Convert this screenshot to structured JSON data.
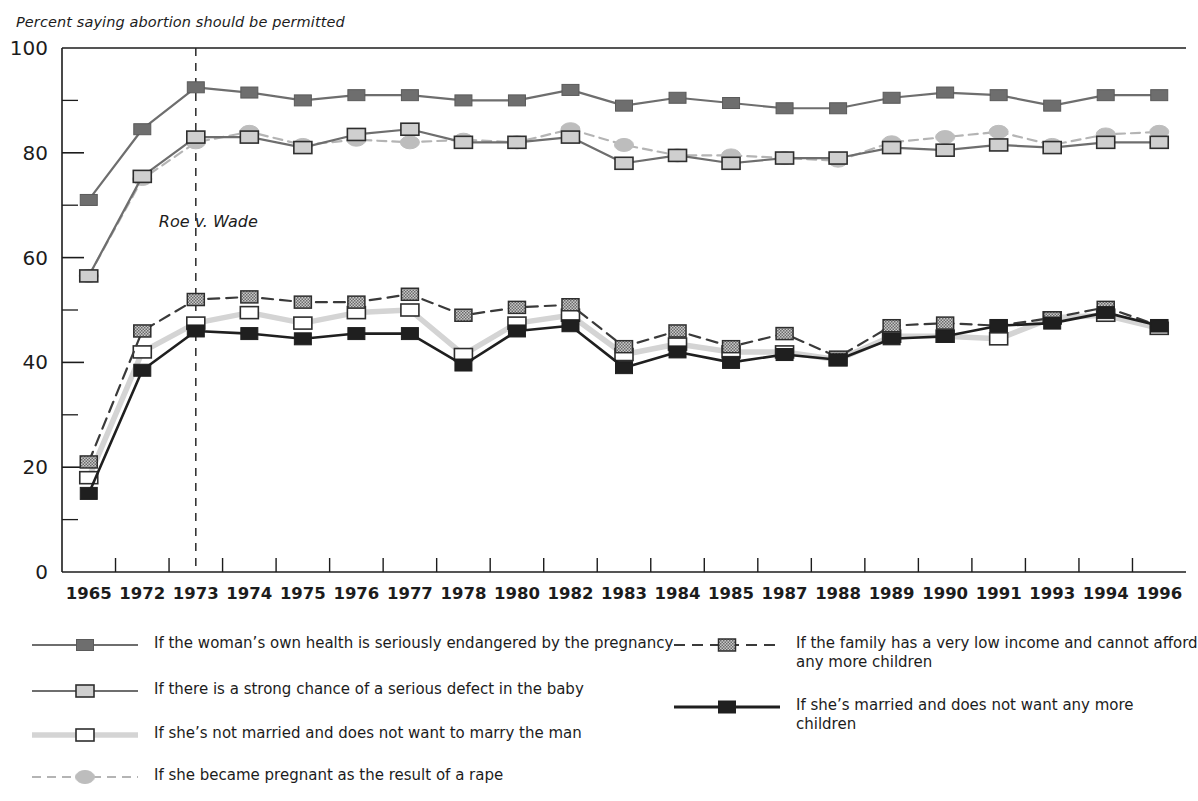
{
  "chart_data": {
    "type": "line",
    "title": "Percent saying abortion should be permitted",
    "ylabel": "Percent saying abortion should be permitted",
    "xlabel": "",
    "ylim": [
      0,
      100
    ],
    "yticks": [
      0,
      20,
      40,
      60,
      80,
      100
    ],
    "yticks_minor": [
      10,
      30,
      50,
      70,
      90
    ],
    "grid": false,
    "legend_position": "bottom",
    "categories": [
      "1965",
      "1972",
      "1973",
      "1974",
      "1975",
      "1976",
      "1977",
      "1978",
      "1980",
      "1982",
      "1983",
      "1984",
      "1985",
      "1987",
      "1988",
      "1989",
      "1990",
      "1991",
      "1993",
      "1994",
      "1996"
    ],
    "annotations": [
      {
        "text": "Roe v. Wade",
        "at_category": "1973",
        "style": "vertical-dashed-line"
      }
    ],
    "series": [
      {
        "name": "health",
        "label": "If the woman’s own health is seriously endangered by the pregnancy",
        "marker": "filled-square",
        "marker_color": "#6e6e6e",
        "line_style": "solid",
        "line_color": "#6e6e6e",
        "values": [
          71,
          84.5,
          92.5,
          91.5,
          90,
          91,
          91,
          90,
          90,
          92,
          89,
          90.5,
          89.5,
          88.5,
          88.5,
          90.5,
          91.5,
          91,
          89,
          91,
          91
        ]
      },
      {
        "name": "defect",
        "label": "If there is a strong chance of a serious defect in the baby",
        "marker": "light-square",
        "marker_color": "#d0d0d0",
        "line_style": "solid",
        "line_color": "#6e6e6e",
        "values": [
          56.5,
          75.5,
          83,
          83,
          81,
          83.5,
          84.5,
          82,
          82,
          83,
          78,
          79.5,
          78,
          79,
          79,
          81,
          80.5,
          81.5,
          81,
          82,
          82
        ]
      },
      {
        "name": "not-married",
        "label": "If she’s not married and does not want to marry the man",
        "marker": "white-square",
        "marker_color": "#ffffff",
        "line_style": "solid",
        "line_color": "#d4d4d4",
        "values": [
          18,
          42,
          47.5,
          49.5,
          47.5,
          49.5,
          50,
          41.5,
          47.5,
          49,
          41.5,
          43.5,
          42,
          42,
          40.5,
          45,
          45,
          44.5,
          48.5,
          49,
          46.5
        ]
      },
      {
        "name": "rape",
        "label": "If she became pregnant as the result of a rape",
        "marker": "filled-circle",
        "marker_color": "#b4b4b4",
        "line_style": "dashed",
        "line_color": "#b4b4b4",
        "values": [
          56.5,
          75,
          82,
          84,
          81.5,
          82.5,
          82,
          82.5,
          82,
          84.5,
          81.5,
          79.5,
          79.5,
          79,
          78.5,
          82,
          83,
          84,
          81.5,
          83.5,
          84
        ]
      },
      {
        "name": "low-income",
        "label": "If the family has a very low income and cannot afford\nany more children",
        "marker": "hatched-square",
        "marker_color": "#9a9a9a",
        "line_style": "dashed",
        "line_color": "#3a3a3a",
        "values": [
          21,
          46,
          52,
          52.5,
          51.5,
          51.5,
          53,
          49,
          50.5,
          51,
          43,
          46,
          43,
          45.5,
          41,
          47,
          47.5,
          47,
          48.5,
          50.5,
          47
        ]
      },
      {
        "name": "married",
        "label": "If she’s married and does not want any more children",
        "marker": "dark-square",
        "marker_color": "#1f1f1f",
        "line_style": "solid",
        "line_color": "#1f1f1f",
        "values": [
          15,
          38.5,
          46,
          45.5,
          44.5,
          45.5,
          45.5,
          39.5,
          46,
          47,
          39,
          42,
          40,
          41.5,
          40.5,
          44.5,
          45,
          47,
          47.5,
          49.5,
          47
        ]
      }
    ]
  },
  "legend": {
    "column_left_items": [
      "health",
      "defect",
      "not-married",
      "rape"
    ],
    "column_right_items": [
      "low-income",
      "married"
    ]
  }
}
